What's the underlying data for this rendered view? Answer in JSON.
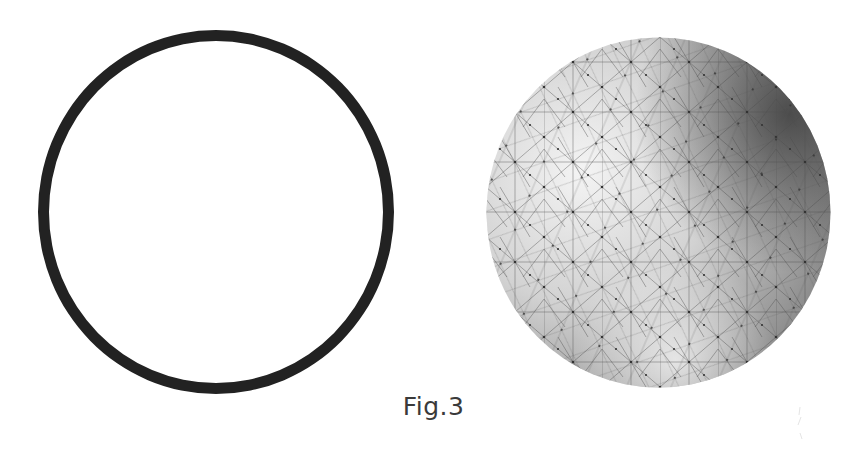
{
  "figure": {
    "caption": "Fig.3",
    "left_panel": {
      "shape": "circle-outline",
      "stroke_color": "#222222",
      "fill": "#ffffff"
    },
    "right_panel": {
      "shape": "triangulated-sphere",
      "shading": "grayscale, darkest at upper-right",
      "mesh_color": "#444444"
    }
  }
}
